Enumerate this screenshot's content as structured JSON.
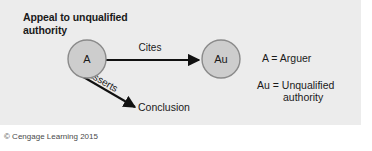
{
  "figure": {
    "title_line1": "Appeal to unqualified",
    "title_line2": "authority",
    "credit": "© Cengage Learning 2015",
    "panel_color": "#ececec",
    "node_fill": "#cdcdcd",
    "node_stroke": "#8a8a8a",
    "line_color": "#111111"
  },
  "diagram": {
    "nodes": [
      {
        "id": "arguer",
        "label": "A",
        "cx": 87,
        "cy": 59,
        "r": 19
      },
      {
        "id": "authority",
        "label": "Au",
        "cx": 221,
        "cy": 59,
        "r": 19
      }
    ],
    "edges": [
      {
        "id": "cites",
        "label": "Cites",
        "from": "arguer",
        "to": "authority"
      },
      {
        "id": "asserts",
        "label": "Asserts",
        "from": "arguer",
        "to": "conclusion"
      }
    ],
    "terminal": {
      "id": "conclusion",
      "label": "Conclusion"
    }
  },
  "legend": {
    "arguer": "A = Arguer",
    "authority_line1": "Au = Unqualified",
    "authority_line2": "authority"
  }
}
